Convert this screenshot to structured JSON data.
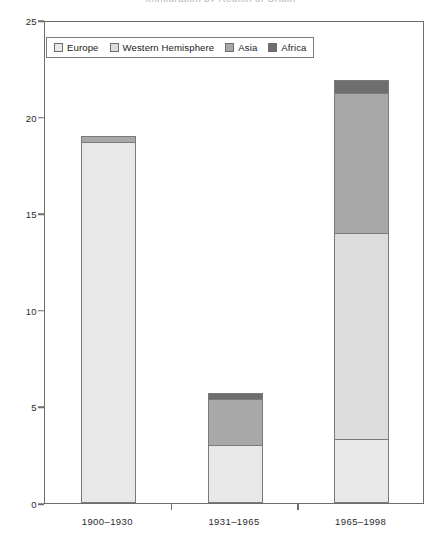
{
  "chart_data": {
    "type": "bar",
    "subtype": "stacked",
    "title": "",
    "xlabel": "",
    "ylabel": "",
    "ylim": [
      0,
      25
    ],
    "yticks": [
      0,
      5,
      10,
      15,
      20,
      25
    ],
    "grid": false,
    "legend_position": "top-left",
    "categories": [
      "1900–1930",
      "1931–1965",
      "1965–1998"
    ],
    "series": [
      {
        "name": "Europe",
        "color": "#e8e8e8",
        "values": [
          18.7,
          3.0,
          3.3
        ]
      },
      {
        "name": "Western Hemisphere",
        "color": "#dcdcdc",
        "values": [
          0.0,
          0.0,
          10.7
        ]
      },
      {
        "name": "Asia",
        "color": "#a8a8a8",
        "values": [
          0.3,
          2.4,
          7.2
        ]
      },
      {
        "name": "Africa",
        "color": "#6e6e6e",
        "values": [
          0.0,
          0.3,
          0.7
        ]
      }
    ],
    "totals": [
      19.0,
      5.7,
      21.9
    ]
  },
  "legend": {
    "items": [
      {
        "label": "Europe",
        "swatch": "#e8e8e8"
      },
      {
        "label": "Western Hemisphere",
        "swatch": "#dcdcdc"
      },
      {
        "label": "Asia",
        "swatch": "#a8a8a8"
      },
      {
        "label": "Africa",
        "swatch": "#6e6e6e"
      }
    ]
  },
  "axis": {
    "y_labels": [
      "0",
      "5",
      "10",
      "15",
      "20",
      "25"
    ],
    "x_labels": [
      "1900–1930",
      "1931–1965",
      "1965–1998"
    ]
  },
  "title_strip": "Immigration by Region of Origin"
}
